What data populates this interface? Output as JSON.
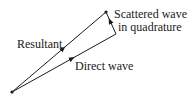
{
  "diagram": {
    "labels": {
      "resultant": "Resultant",
      "direct": "Direct wave",
      "scattered_line1": "Scattered wave",
      "scattered_line2": "in quadrature"
    },
    "points": {
      "origin": [
        12,
        92
      ],
      "direct_tip": [
        116,
        34
      ],
      "resultant_tip": [
        106,
        12
      ]
    },
    "colors": {
      "line": "#1a1a1a",
      "background": "#ffffff"
    }
  }
}
